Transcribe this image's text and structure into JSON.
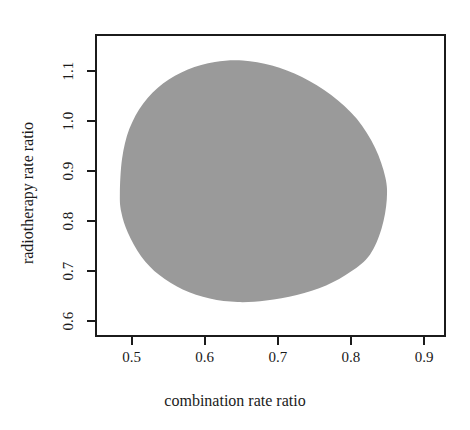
{
  "chart_data": {
    "type": "area",
    "title": "",
    "subtitle": "",
    "xlabel": "combination rate ratio",
    "ylabel": "radiotherapy rate ratio",
    "xlim": [
      0.45,
      0.93
    ],
    "ylim": [
      0.568,
      1.175
    ],
    "xticks": [
      "0.5",
      "0.6",
      "0.7",
      "0.8",
      "0.9"
    ],
    "xtick_values": [
      0.5,
      0.6,
      0.7,
      0.8,
      0.9
    ],
    "yticks": [
      "0.6",
      "0.7",
      "0.8",
      "0.9",
      "1.0",
      "1.1"
    ],
    "ytick_values": [
      0.6,
      0.7,
      0.8,
      0.9,
      1.0,
      1.1
    ],
    "grid": false,
    "legend": "none",
    "series": [
      {
        "name": "joint confidence region",
        "fill_color": "#9a9a9a",
        "x_range": [
          0.484,
          0.849
        ],
        "y_range": [
          0.638,
          1.122
        ],
        "boundary": [
          {
            "x": 0.484,
            "y": 0.855
          },
          {
            "x": 0.487,
            "y": 0.925
          },
          {
            "x": 0.497,
            "y": 0.985
          },
          {
            "x": 0.516,
            "y": 1.036
          },
          {
            "x": 0.543,
            "y": 1.076
          },
          {
            "x": 0.577,
            "y": 1.104
          },
          {
            "x": 0.614,
            "y": 1.119
          },
          {
            "x": 0.652,
            "y": 1.122
          },
          {
            "x": 0.692,
            "y": 1.112
          },
          {
            "x": 0.733,
            "y": 1.089
          },
          {
            "x": 0.773,
            "y": 1.053
          },
          {
            "x": 0.808,
            "y": 1.005
          },
          {
            "x": 0.833,
            "y": 0.947
          },
          {
            "x": 0.847,
            "y": 0.888
          },
          {
            "x": 0.849,
            "y": 0.843
          },
          {
            "x": 0.842,
            "y": 0.786
          },
          {
            "x": 0.826,
            "y": 0.733
          },
          {
            "x": 0.8,
            "y": 0.699
          },
          {
            "x": 0.766,
            "y": 0.671
          },
          {
            "x": 0.726,
            "y": 0.652
          },
          {
            "x": 0.684,
            "y": 0.641
          },
          {
            "x": 0.645,
            "y": 0.638
          },
          {
            "x": 0.607,
            "y": 0.645
          },
          {
            "x": 0.57,
            "y": 0.663
          },
          {
            "x": 0.538,
            "y": 0.692
          },
          {
            "x": 0.513,
            "y": 0.73
          },
          {
            "x": 0.495,
            "y": 0.777
          },
          {
            "x": 0.486,
            "y": 0.818
          }
        ]
      }
    ]
  },
  "axes": {
    "x_title": "combination rate ratio",
    "y_title": "radiotherapy rate ratio",
    "x_tick_labels": [
      "0.5",
      "0.6",
      "0.7",
      "0.8",
      "0.9"
    ],
    "y_tick_labels": [
      "0.6",
      "0.7",
      "0.8",
      "0.9",
      "1.0",
      "1.1"
    ]
  },
  "colors": {
    "region_fill": "#9a9a9a",
    "axis_line": "#1b1b1b",
    "text": "#1a1a1a",
    "background": "#ffffff"
  }
}
